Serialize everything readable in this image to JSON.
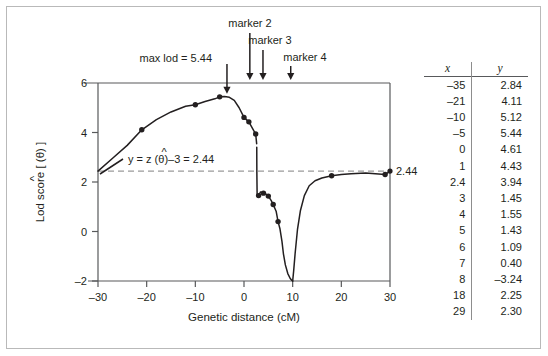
{
  "figure": {
    "title_hidden": "",
    "border_color": "#b9b9b9"
  },
  "axes": {
    "xlabel": "Genetic distance (cM)",
    "ylabel_parts": {
      "pre": "Lod score [ ",
      "theta": "θ",
      "hat": "^",
      "post": " ]"
    },
    "ylabel_plain": "Lod score [ (θ) ]",
    "xticks": [
      "–30",
      "–20",
      "–10",
      "0",
      "10",
      "20",
      "30"
    ],
    "xtick_values": [
      -30,
      -20,
      -10,
      0,
      10,
      20,
      30
    ],
    "yticks": [
      "–2",
      "0",
      "2",
      "4",
      "6"
    ],
    "ytick_values": [
      -2,
      0,
      2,
      4,
      6
    ],
    "xlim": [
      -30,
      30
    ],
    "ylim": [
      -2,
      6
    ]
  },
  "annotations": {
    "max_lod": "max lod = 5.44",
    "marker2": "marker 2",
    "marker3": "marker 3",
    "marker4": "marker 4",
    "equation_pre": "y = z (",
    "equation_theta": "θ",
    "equation_post": ")–3 = 2.44",
    "equation_plain": "y = z (θ)–3 = 2.44",
    "threshold_label": "2.44"
  },
  "arrows": [
    {
      "name": "max-lod-arrow",
      "x": -3.5,
      "label": "max lod = 5.44"
    },
    {
      "name": "marker2-arrow",
      "x": 1.2,
      "label": "marker 2"
    },
    {
      "name": "marker3-arrow",
      "x": 3.9,
      "label": "marker 3"
    },
    {
      "name": "marker4-arrow",
      "x": 9.6,
      "label": "marker 4"
    }
  ],
  "table": {
    "headers": [
      "x",
      "y"
    ],
    "rows": [
      [
        "–35",
        "2.84"
      ],
      [
        "–21",
        "4.11"
      ],
      [
        "–10",
        "5.12"
      ],
      [
        "–5",
        "5.44"
      ],
      [
        "0",
        "4.61"
      ],
      [
        "1",
        "4.43"
      ],
      [
        "2.4",
        "3.94"
      ],
      [
        "3",
        "1.45"
      ],
      [
        "4",
        "1.55"
      ],
      [
        "5",
        "1.43"
      ],
      [
        "6",
        "1.09"
      ],
      [
        "7",
        "0.40"
      ],
      [
        "8",
        "–3.24"
      ],
      [
        "18",
        "2.25"
      ],
      [
        "29",
        "2.30"
      ]
    ]
  },
  "chart_data": {
    "type": "line",
    "title": "",
    "xlabel": "Genetic distance (cM)",
    "ylabel": "Lod score [ (θ) ]",
    "xlim": [
      -30,
      30
    ],
    "ylim": [
      -2,
      6
    ],
    "grid": false,
    "legend": null,
    "threshold_line": {
      "y": 2.44,
      "style": "dashed",
      "color": "#9a9a9a",
      "label": "2.44"
    },
    "points": {
      "x": [
        -35,
        -21,
        -10,
        -5,
        0,
        1,
        2.4,
        3,
        4,
        5,
        6,
        7,
        8,
        18,
        29
      ],
      "y": [
        2.84,
        4.11,
        5.12,
        5.44,
        4.61,
        4.43,
        3.94,
        1.45,
        1.55,
        1.43,
        1.09,
        0.4,
        -3.24,
        2.25,
        2.3
      ]
    },
    "visible_points": {
      "x": [
        -21,
        -10,
        -5,
        0,
        1,
        2.4,
        3,
        4,
        5,
        6,
        7,
        18,
        29
      ],
      "y": [
        4.11,
        5.12,
        5.44,
        4.61,
        4.43,
        3.94,
        1.45,
        1.55,
        1.43,
        1.09,
        0.4,
        2.25,
        2.3
      ]
    },
    "curve_segments": [
      {
        "name": "left-branch",
        "x": [
          -30,
          -27,
          -24,
          -21,
          -18,
          -15,
          -12,
          -10,
          -8,
          -6,
          -5,
          -4,
          -3,
          -2,
          -1,
          0,
          0.5,
          1,
          1.6,
          2.0,
          2.4,
          2.6
        ],
        "y": [
          2.44,
          2.96,
          3.48,
          4.11,
          4.52,
          4.83,
          5.06,
          5.12,
          5.25,
          5.36,
          5.44,
          5.45,
          5.42,
          5.3,
          5.0,
          4.61,
          4.52,
          4.43,
          4.22,
          4.08,
          3.94,
          3.55
        ]
      },
      {
        "name": "drop-to-trough",
        "x": [
          2.62,
          2.64,
          2.7,
          3,
          3.4,
          4,
          4.6,
          5,
          5.6,
          6,
          6.6,
          7,
          7.4,
          7.8,
          8.1,
          8.5,
          9,
          9.5,
          9.85,
          10
        ],
        "y": [
          3.4,
          2.4,
          1.45,
          1.45,
          1.6,
          1.55,
          1.5,
          1.43,
          1.25,
          1.09,
          0.82,
          0.4,
          0.1,
          -0.4,
          -0.9,
          -1.35,
          -1.7,
          -1.9,
          -1.98,
          -2.0
        ]
      },
      {
        "name": "right-branch",
        "x": [
          10,
          10.2,
          10.5,
          11,
          11.6,
          12.4,
          13.4,
          14.6,
          16,
          18,
          20,
          22,
          25,
          29,
          30
        ],
        "y": [
          -2.0,
          -1.6,
          -0.9,
          0.1,
          0.85,
          1.45,
          1.85,
          2.05,
          2.16,
          2.25,
          2.3,
          2.33,
          2.36,
          2.3,
          2.44
        ]
      }
    ]
  }
}
